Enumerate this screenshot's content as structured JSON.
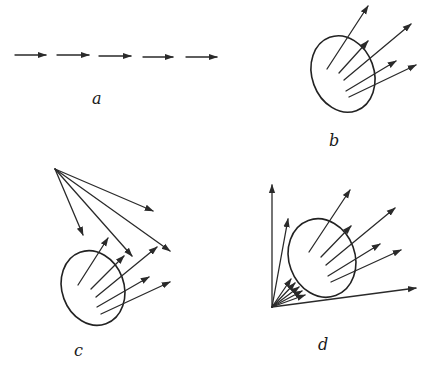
{
  "panels": [
    {
      "id": "a",
      "label": "a",
      "label_pos": [
        92,
        104
      ],
      "blob": null,
      "arrows": [
        [
          15,
          55,
          46,
          55
        ],
        [
          57,
          55,
          89,
          55
        ],
        [
          99,
          56,
          131,
          56
        ],
        [
          143,
          57,
          173,
          57
        ],
        [
          186,
          57,
          217,
          57
        ]
      ]
    },
    {
      "id": "b",
      "label": "b",
      "label_pos": [
        329,
        146
      ],
      "blob": {
        "cx": 343,
        "cy": 74,
        "rx": 31,
        "ry": 39,
        "rot": -20
      },
      "arrows": [
        [
          327,
          69,
          368,
          6
        ],
        [
          339,
          73,
          368,
          41
        ],
        [
          344,
          80,
          411,
          24
        ],
        [
          346,
          91,
          396,
          61
        ],
        [
          349,
          97,
          416,
          65
        ]
      ]
    },
    {
      "id": "c",
      "label": "c",
      "label_pos": [
        74,
        356
      ],
      "blob": {
        "cx": 93,
        "cy": 288,
        "rx": 31,
        "ry": 38,
        "rot": -20
      },
      "arrows": [
        [
          55,
          169,
          153,
          211
        ],
        [
          55,
          169,
          83,
          235
        ],
        [
          55,
          169,
          132,
          256
        ],
        [
          55,
          169,
          170,
          251
        ],
        [
          78,
          285,
          108,
          238
        ],
        [
          91,
          289,
          124,
          256
        ],
        [
          96,
          297,
          157,
          247
        ],
        [
          97,
          307,
          149,
          277
        ],
        [
          101,
          314,
          170,
          282
        ]
      ]
    },
    {
      "id": "d",
      "label": "d",
      "label_pos": [
        318,
        350
      ],
      "blob": {
        "cx": 322,
        "cy": 258,
        "rx": 33,
        "ry": 40,
        "rot": -20
      },
      "arrows": [
        [
          272,
          307,
          272,
          185
        ],
        [
          272,
          307,
          416,
          288
        ],
        [
          272,
          307,
          288,
          219
        ],
        [
          272,
          307,
          291,
          279
        ],
        [
          272,
          307,
          295,
          283
        ],
        [
          272,
          307,
          299,
          287
        ],
        [
          272,
          307,
          302,
          291
        ],
        [
          272,
          307,
          305,
          295
        ],
        [
          309,
          252,
          350,
          190
        ],
        [
          321,
          257,
          351,
          226
        ],
        [
          326,
          265,
          395,
          208
        ],
        [
          328,
          276,
          380,
          244
        ],
        [
          331,
          282,
          401,
          250
        ]
      ]
    }
  ],
  "style": {
    "ink": "#2a2a2a",
    "background": "#ffffff"
  }
}
